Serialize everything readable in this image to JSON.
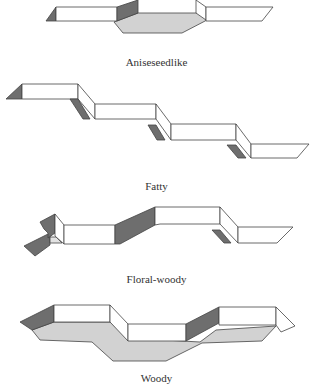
{
  "figures": [
    {
      "label": "Aniseseedlike",
      "colors": {
        "face": "#ffffff",
        "dark": "#6e6e6e",
        "floor": "#d2d2d2"
      }
    },
    {
      "label": "Fatty",
      "colors": {
        "face": "#ffffff",
        "dark": "#6e6e6e"
      }
    },
    {
      "label": "Floral-woody",
      "colors": {
        "face": "#ffffff",
        "dark": "#6e6e6e",
        "light": "#e2e2e2"
      }
    },
    {
      "label": "Woody",
      "colors": {
        "face": "#ffffff",
        "dark": "#6e6e6e",
        "floor": "#d2d2d2"
      }
    }
  ]
}
